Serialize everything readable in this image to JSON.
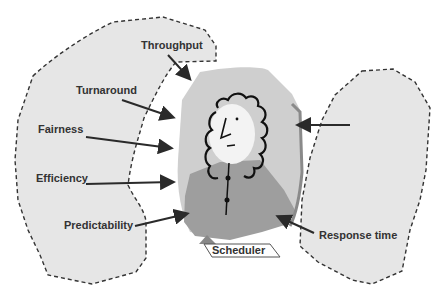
{
  "diagram": {
    "center_label": "Scheduler",
    "criteria": [
      {
        "label": "Throughput"
      },
      {
        "label": "Turnaround"
      },
      {
        "label": "Fairness"
      },
      {
        "label": "Efficiency"
      },
      {
        "label": "Predictability"
      },
      {
        "label": "Response time"
      }
    ],
    "colors": {
      "blob_fill": "#e6e6e6",
      "blob_stroke": "#333333",
      "scheduler_light": "#cfcfcf",
      "scheduler_dark": "#9e9e9e",
      "arrow": "#2a2a2a",
      "text": "#333333"
    }
  }
}
